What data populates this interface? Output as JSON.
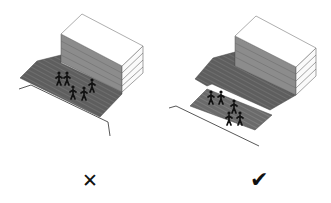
{
  "panels": [
    {
      "id": "bad",
      "verdict": "incorrect",
      "mark_symbol": "✕",
      "mark_name": "cross-icon",
      "description": "Courtyard with people in open space at corner of building"
    },
    {
      "id": "good",
      "verdict": "correct",
      "mark_symbol": "✔",
      "mark_name": "checkmark-icon",
      "description": "Courtyard with people in a sheltered area in front of building"
    }
  ],
  "colors": {
    "ground": "#5a5a5a",
    "ground_light": "#7a7a7a",
    "building_side": "#8a8a8a",
    "building_top": "#ffffff",
    "line": "#333333",
    "figure": "#111111"
  }
}
